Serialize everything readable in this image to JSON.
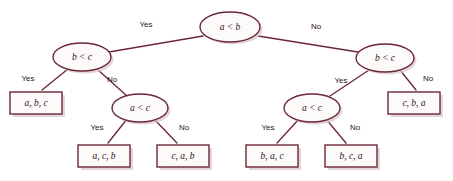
{
  "diagram": {
    "type": "decision-tree",
    "colors": {
      "stroke": "#6b2737",
      "node_fill": "#fdfafa",
      "leaf_fill": "#fdfafa",
      "shadow": "#d9c7cb",
      "text": "#2a1419",
      "background": "#ffffff"
    },
    "nodes": {
      "root": {
        "label": "a < b",
        "cx": 230,
        "cy": 27,
        "rx": 30,
        "ry": 15
      },
      "left": {
        "label": "b < c",
        "cx": 82,
        "cy": 57,
        "rx": 29,
        "ry": 14
      },
      "right": {
        "label": "b < c",
        "cx": 385,
        "cy": 58,
        "rx": 29,
        "ry": 14
      },
      "left_inner": {
        "label": "a < c",
        "cx": 140,
        "cy": 108,
        "rx": 28,
        "ry": 14
      },
      "right_inner": {
        "label": "a < c",
        "cx": 312,
        "cy": 108,
        "rx": 28,
        "ry": 14
      }
    },
    "leaves": [
      {
        "label": "a, b, c",
        "x": 10,
        "y": 92,
        "w": 52,
        "h": 22
      },
      {
        "label": "a, c, b",
        "x": 78,
        "y": 145,
        "w": 52,
        "h": 22
      },
      {
        "label": "c, a, b",
        "x": 157,
        "y": 145,
        "w": 52,
        "h": 22
      },
      {
        "label": "b, a, c",
        "x": 246,
        "y": 145,
        "w": 52,
        "h": 22
      },
      {
        "label": "b, c, a",
        "x": 325,
        "y": 145,
        "w": 52,
        "h": 22
      },
      {
        "label": "c, b, a",
        "x": 388,
        "y": 92,
        "w": 52,
        "h": 22
      }
    ],
    "edge_labels": {
      "root_yes": "Yes",
      "root_no": "No",
      "left_yes": "Yes",
      "left_no": "No",
      "right_yes": "Yes",
      "right_no": "No",
      "left_inner_yes": "Yes",
      "left_inner_no": "No",
      "right_inner_yes": "Yes",
      "right_inner_no": "No"
    },
    "edge_label_positions": {
      "root_yes": {
        "x": 146,
        "y": 25
      },
      "root_no": {
        "x": 316,
        "y": 27
      },
      "left_yes": {
        "x": 28,
        "y": 79
      },
      "left_no": {
        "x": 112,
        "y": 80
      },
      "right_yes": {
        "x": 341,
        "y": 81
      },
      "right_no": {
        "x": 428,
        "y": 79
      },
      "left_inner_yes": {
        "x": 97,
        "y": 128
      },
      "left_inner_no": {
        "x": 184,
        "y": 128
      },
      "right_inner_yes": {
        "x": 268,
        "y": 128
      },
      "right_inner_no": {
        "x": 355,
        "y": 128
      }
    }
  }
}
